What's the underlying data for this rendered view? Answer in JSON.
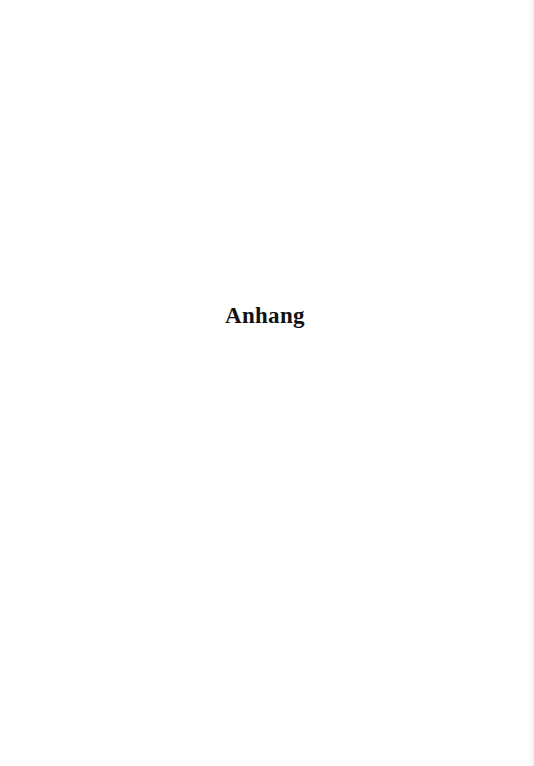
{
  "page": {
    "heading": "Anhang"
  }
}
